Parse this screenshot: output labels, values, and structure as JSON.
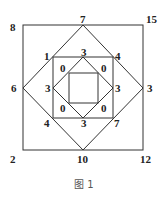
{
  "figure": {
    "caption": "图 1",
    "outer_corners": {
      "top_left": "8",
      "top_right": "15",
      "bottom_left": "2",
      "bottom_right": "12"
    },
    "outer_midpoints": {
      "top": "7",
      "right": "3",
      "bottom": "10",
      "left": "6"
    },
    "middle_corners": {
      "top_left": "1",
      "top_right": "4",
      "bottom_left": "4",
      "bottom_right": "7"
    },
    "middle_midpoints": {
      "top": "3",
      "right": "3",
      "bottom": "3",
      "left": "3"
    },
    "inner_corners": {
      "top_left": "0",
      "top_right": "0",
      "bottom_left": "0",
      "bottom_right": "0"
    }
  }
}
